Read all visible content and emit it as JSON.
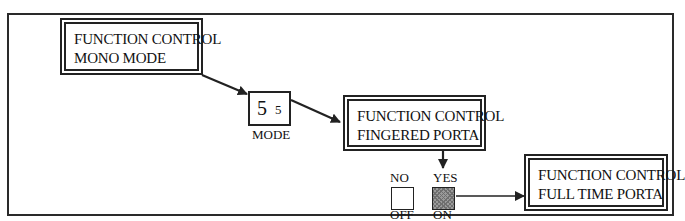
{
  "diagram": {
    "boxes": {
      "mono_mode": {
        "line1": "FUNCTION CONTROL",
        "line2": "MONO MODE"
      },
      "fingered_porta": {
        "line1": "FUNCTION CONTROL",
        "line2": "FINGERED PORTA"
      },
      "full_time_porta": {
        "line1": "FUNCTION CONTROL",
        "line2": "FULL TIME PORTA"
      }
    },
    "mode_display": {
      "large_digit": "5",
      "small_digit": "5",
      "label": "MODE"
    },
    "switch": {
      "no_label": "NO",
      "off_label": "OFF",
      "yes_label": "YES",
      "on_label": "ON",
      "selected": "ON"
    },
    "colors": {
      "line": "#222222",
      "switch_on_fill": "#9a9a9a"
    }
  }
}
